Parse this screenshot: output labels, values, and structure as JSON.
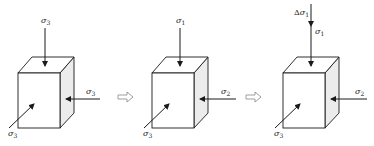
{
  "figure": {
    "panels": [
      {
        "name": "state-1",
        "top_label": {
          "sym": "σ",
          "sub": "3",
          "prefix": ""
        },
        "right_label": {
          "sym": "σ",
          "sub": "3"
        },
        "front_label": {
          "sym": "σ",
          "sub": "3"
        }
      },
      {
        "name": "state-2",
        "top_label": {
          "sym": "σ",
          "sub": "1",
          "prefix": ""
        },
        "right_label": {
          "sym": "σ",
          "sub": "2"
        },
        "front_label": {
          "sym": "σ",
          "sub": "3"
        }
      },
      {
        "name": "state-3",
        "delta_label": {
          "prefix": "Δ",
          "sym": "σ",
          "sub": "1"
        },
        "top_label": {
          "sym": "σ",
          "sub": "1",
          "prefix": ""
        },
        "right_label": {
          "sym": "σ",
          "sub": "2"
        },
        "front_label": {
          "sym": "σ",
          "sub": "3"
        }
      }
    ],
    "transition_arrows": 2,
    "colors": {
      "line": "#1a1a1a",
      "side_shade": "#ececec",
      "arrow_outline": "#888888"
    }
  }
}
